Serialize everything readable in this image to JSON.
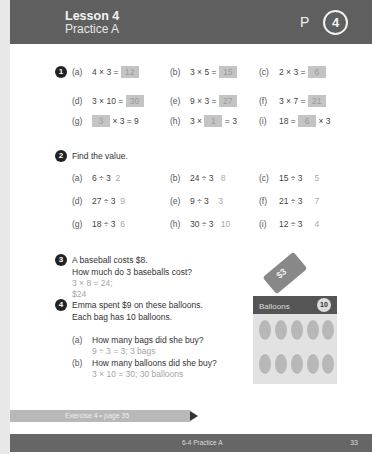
{
  "header": {
    "lesson_title": "Lesson 4",
    "lesson_subtitle": "Practice A",
    "p_label": "P",
    "p_number": "4"
  },
  "q1": {
    "number": "1",
    "items": [
      {
        "label": "(a)",
        "pre": "4 × 3 =",
        "box": "12",
        "post": ""
      },
      {
        "label": "(b)",
        "pre": "3 × 5 =",
        "box": "15",
        "post": ""
      },
      {
        "label": "(c)",
        "pre": "2 × 3 =",
        "box": "6",
        "post": ""
      },
      {
        "label": "(d)",
        "pre": "3 × 10 =",
        "box": "30",
        "post": ""
      },
      {
        "label": "(e)",
        "pre": "9 × 3 =",
        "box": "27",
        "post": ""
      },
      {
        "label": "(f)",
        "pre": "3 × 7 =",
        "box": "21",
        "post": ""
      },
      {
        "label": "(g)",
        "pre": "",
        "box": "3",
        "post": "× 3 = 9"
      },
      {
        "label": "(h)",
        "pre": "3 ×",
        "box": "1",
        "post": "= 3"
      },
      {
        "label": "(i)",
        "pre": "18 =",
        "box": "6",
        "post": "× 3"
      }
    ]
  },
  "q2": {
    "number": "2",
    "prompt": "Find the value.",
    "items": [
      {
        "label": "(a)",
        "expr": "6 ÷ 3",
        "answer": "2"
      },
      {
        "label": "(b)",
        "expr": "24 ÷ 3",
        "answer": "8"
      },
      {
        "label": "(c)",
        "expr": "15 ÷ 3",
        "answer": "5"
      },
      {
        "label": "(d)",
        "expr": "27 ÷ 3",
        "answer": "9"
      },
      {
        "label": "(e)",
        "expr": "9 ÷ 3",
        "answer": "3"
      },
      {
        "label": "(f)",
        "expr": "21 ÷ 3",
        "answer": "7"
      },
      {
        "label": "(g)",
        "expr": "18 ÷ 3",
        "answer": "6"
      },
      {
        "label": "(h)",
        "expr": "30 ÷ 3",
        "answer": "10"
      },
      {
        "label": "(i)",
        "expr": "12 ÷ 3",
        "answer": "4"
      }
    ]
  },
  "q3": {
    "number": "3",
    "line1": "A baseball costs $8.",
    "line2": "How much do 3 baseballs cost?",
    "answer1": "3 × 8 = 24;",
    "answer2": "$24"
  },
  "q4": {
    "number": "4",
    "line1": "Emma spent $9 on these balloons.",
    "line2": "Each bag has 10 balloons.",
    "parts": [
      {
        "label": "(a)",
        "question": "How many bags did she buy?",
        "answer": "9 ÷ 3 = 3; 3 bags"
      },
      {
        "label": "(b)",
        "question": "How many balloons did she buy?",
        "answer": "3 × 10 = 30; 30 balloons"
      }
    ]
  },
  "illustration": {
    "price_tag": "$3",
    "package_label": "Balloons",
    "package_count": "10"
  },
  "banner": {
    "text": "Exercise 4 • page 35"
  },
  "footer": {
    "center": "6-4 Practice A",
    "page": "33"
  }
}
